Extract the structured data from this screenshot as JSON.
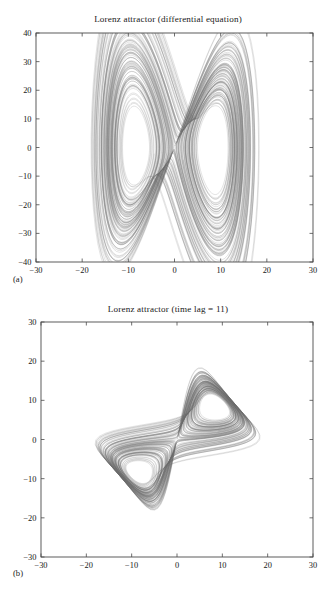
{
  "figure": {
    "background": "#ffffff",
    "line_color": "#6b6b6b",
    "axis_color": "#4a4a4a"
  },
  "panels": [
    {
      "id": "a",
      "panel_label": "(a)",
      "title": "Lorenz attractor (differential equation)"
    },
    {
      "id": "b",
      "panel_label": "(b)",
      "title": "Lorenz attractor (time lag = 11)"
    }
  ],
  "chart_data": [
    {
      "type": "line",
      "title": "Lorenz attractor (differential equation)",
      "panel": "(a)",
      "xlabel": "",
      "ylabel": "",
      "xlim": [
        -30,
        30
      ],
      "ylim": [
        -40,
        40
      ],
      "xticks": [
        -30,
        -20,
        -10,
        0,
        10,
        20,
        30
      ],
      "yticks": [
        -40,
        -30,
        -20,
        -10,
        0,
        10,
        20,
        30,
        40
      ],
      "xticklabels": [
        "−30",
        "−20",
        "−10",
        "0",
        "10",
        "20",
        "30"
      ],
      "yticklabels": [
        "−40",
        "−30",
        "−20",
        "−10",
        "0",
        "10",
        "20",
        "30",
        "40"
      ],
      "grid": false,
      "legend": null,
      "series": [
        {
          "name": "Lorenz x vs dx/dt",
          "description": "Phase portrait of the Lorenz system plotting x against its time derivative dx/dt; produces the classic two-lobe butterfly with lobe centers near (-13, -13) and (13, 13)",
          "generator": "lorenz",
          "params": {
            "sigma": 10,
            "rho": 28,
            "beta": 2.6666666667,
            "x0": 1.0,
            "y0": 1.0,
            "z0": 20.0,
            "dt": 0.004,
            "steps": 42000,
            "transient": 800,
            "plot": "x_vs_dxdt"
          },
          "x_range_observed": [
            -28,
            29
          ],
          "y_range_observed": [
            -39,
            39
          ],
          "lobe_centers": [
            [
              -13,
              -13
            ],
            [
              13,
              13
            ]
          ]
        }
      ]
    },
    {
      "type": "line",
      "title": "Lorenz attractor (time lag = 11)",
      "panel": "(b)",
      "xlabel": "",
      "ylabel": "",
      "xlim": [
        -30,
        30
      ],
      "ylim": [
        -30,
        30
      ],
      "xticks": [
        -30,
        -20,
        -10,
        0,
        10,
        20,
        30
      ],
      "yticks": [
        -30,
        -20,
        -10,
        0,
        10,
        20,
        30
      ],
      "xticklabels": [
        "−30",
        "−20",
        "−10",
        "0",
        "10",
        "20",
        "30"
      ],
      "yticklabels": [
        "−30",
        "−20",
        "−10",
        "0",
        "10",
        "20",
        "30"
      ],
      "grid": false,
      "legend": null,
      "series": [
        {
          "name": "Lorenz x(t) vs x(t + 11)",
          "description": "Time-delay embedding of the Lorenz x coordinate with lag of 11 samples; produces an angular two-lobe reconstruction with lobe centers near (-12, -12) and (12, 12)",
          "generator": "lorenz",
          "params": {
            "sigma": 10,
            "rho": 28,
            "beta": 2.6666666667,
            "x0": 1.0,
            "y0": 1.0,
            "z0": 20.0,
            "dt": 0.004,
            "steps": 42000,
            "transient": 800,
            "plot": "delay_embedding",
            "time_lag": 11,
            "sample_stride": 4
          },
          "x_range_observed": [
            -29,
            29
          ],
          "y_range_observed": [
            -29,
            29
          ],
          "lobe_centers": [
            [
              -12,
              -12
            ],
            [
              12,
              12
            ]
          ]
        }
      ]
    }
  ]
}
